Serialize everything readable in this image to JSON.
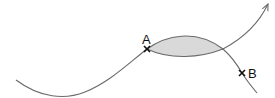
{
  "diagram": {
    "points": [
      {
        "id": "A",
        "label": "A"
      },
      {
        "id": "B",
        "label": "B"
      }
    ],
    "elements": {
      "curve_1": "curve ending in arrow, passing through A",
      "curve_2": "curve from A passing through B",
      "lens": "shaded region between the two curves starting at A"
    },
    "colors": {
      "curve": "#6a6a6a",
      "lens_fill": "#d9d9d9",
      "marks": "#111111"
    }
  }
}
